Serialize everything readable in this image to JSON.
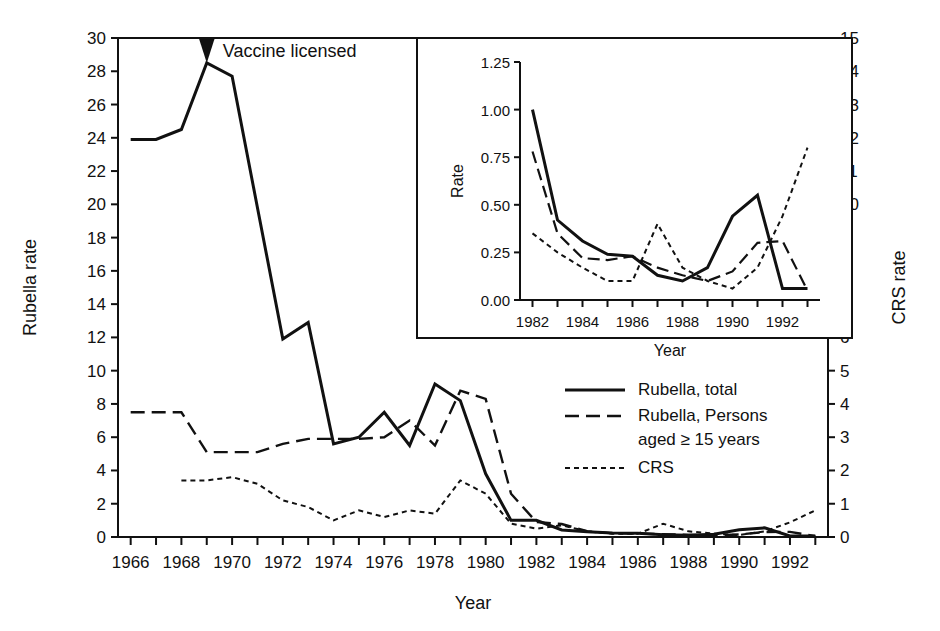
{
  "figure": {
    "annotation": "Vaccine licensed",
    "background": "#ffffff",
    "ink_color": "#111111"
  },
  "main_axes": {
    "ylabel_left": "Rubella rate",
    "ylabel_right": "CRS rate",
    "xlabel": "Year",
    "y_left_ticks": [
      "0",
      "2",
      "4",
      "6",
      "8",
      "10",
      "12",
      "14",
      "16",
      "18",
      "20",
      "22",
      "24",
      "26",
      "28",
      "30"
    ],
    "y_right_ticks": [
      "0",
      "1",
      "2",
      "3",
      "4",
      "5",
      "6",
      "7",
      "8",
      "9",
      "10",
      "11",
      "12",
      "13",
      "14",
      "15"
    ],
    "x_ticks": [
      "1966",
      "1968",
      "1970",
      "1972",
      "1974",
      "1976",
      "1978",
      "1980",
      "1982",
      "1984",
      "1986",
      "1988",
      "1990",
      "1992"
    ]
  },
  "inset_axes": {
    "ylabel": "Rate",
    "xlabel": "Year",
    "y_ticks": [
      "0.00",
      "0.25",
      "0.50",
      "0.75",
      "1.00",
      "1.25"
    ],
    "x_ticks": [
      "1982",
      "1984",
      "1986",
      "1988",
      "1990",
      "1992"
    ]
  },
  "legend": {
    "items": [
      {
        "label": "Rubella, total",
        "style": "solid"
      },
      {
        "label": "Rubella, Persons",
        "label2": "aged ≥ 15 years",
        "style": "dashed"
      },
      {
        "label": "CRS",
        "style": "dotted"
      }
    ]
  },
  "chart_data": [
    {
      "type": "line",
      "id": "main",
      "title": "",
      "xlabel": "Year",
      "ylabel": "Rubella rate",
      "ylabel_secondary": "CRS rate",
      "xlim": [
        1965.5,
        1993.5
      ],
      "ylim": [
        0,
        30
      ],
      "ylim_secondary": [
        0,
        15
      ],
      "grid": false,
      "legend_position": "center-right",
      "annotations": [
        {
          "text": "Vaccine licensed",
          "x": 1969,
          "y": 30,
          "marker": "down-triangle"
        }
      ],
      "x": [
        1966,
        1967,
        1968,
        1969,
        1970,
        1971,
        1972,
        1973,
        1974,
        1975,
        1976,
        1977,
        1978,
        1979,
        1980,
        1981,
        1982,
        1983,
        1984,
        1985,
        1986,
        1987,
        1988,
        1989,
        1990,
        1991,
        1992,
        1993
      ],
      "series": [
        {
          "name": "Rubella, total",
          "axis": "left",
          "style": "solid",
          "values": [
            23.9,
            23.9,
            24.5,
            28.5,
            27.7,
            19.8,
            11.9,
            12.9,
            5.6,
            6.0,
            7.5,
            5.5,
            9.2,
            8.2,
            3.8,
            1.0,
            1.0,
            0.42,
            0.31,
            0.24,
            0.23,
            0.13,
            0.1,
            0.17,
            0.44,
            0.55,
            0.06,
            0.06
          ]
        },
        {
          "name": "Rubella, Persons aged ≥ 15 years",
          "axis": "left",
          "style": "dashed",
          "values": [
            7.5,
            7.5,
            7.5,
            5.1,
            5.1,
            5.1,
            5.6,
            5.9,
            5.9,
            5.9,
            6.0,
            7.0,
            5.5,
            8.8,
            8.3,
            2.6,
            0.9,
            0.78,
            0.35,
            0.22,
            0.21,
            0.17,
            0.13,
            0.1,
            0.15,
            0.3,
            0.31,
            0.05
          ]
        },
        {
          "name": "CRS",
          "axis": "right",
          "style": "dotted",
          "values": [
            null,
            null,
            1.7,
            1.7,
            1.8,
            1.6,
            1.1,
            0.9,
            0.5,
            0.8,
            0.6,
            0.8,
            0.7,
            1.7,
            1.3,
            0.4,
            0.25,
            0.35,
            0.17,
            0.1,
            0.1,
            0.4,
            0.17,
            0.1,
            0.06,
            0.17,
            0.44,
            0.8
          ]
        }
      ]
    },
    {
      "type": "line",
      "id": "inset",
      "title": "",
      "xlabel": "Year",
      "ylabel": "Rate",
      "xlim": [
        1981.5,
        1993.5
      ],
      "ylim": [
        0.0,
        1.25
      ],
      "grid": false,
      "x": [
        1982,
        1983,
        1984,
        1985,
        1986,
        1987,
        1988,
        1989,
        1990,
        1991,
        1992,
        1993
      ],
      "series": [
        {
          "name": "Rubella, total",
          "style": "solid",
          "values": [
            1.0,
            0.42,
            0.31,
            0.24,
            0.23,
            0.13,
            0.1,
            0.17,
            0.44,
            0.55,
            0.06,
            0.06
          ]
        },
        {
          "name": "Rubella, Persons aged ≥ 15 years",
          "style": "dashed",
          "values": [
            0.78,
            0.35,
            0.22,
            0.21,
            0.23,
            0.17,
            0.13,
            0.1,
            0.15,
            0.3,
            0.31,
            0.05
          ]
        },
        {
          "name": "CRS",
          "style": "dotted",
          "values": [
            0.35,
            0.25,
            0.17,
            0.1,
            0.1,
            0.4,
            0.17,
            0.1,
            0.06,
            0.17,
            0.44,
            0.8
          ]
        }
      ]
    }
  ]
}
